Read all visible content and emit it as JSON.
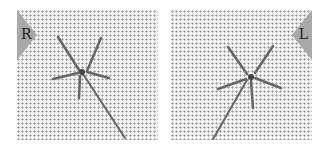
{
  "panels": [
    {
      "id": "right-hand",
      "label": "R",
      "flag_color": "#a8a8a8"
    },
    {
      "id": "left-hand",
      "label": "L",
      "flag_color": "#a8a8a8"
    }
  ],
  "colors": {
    "fabric": "#f4f4f4",
    "fabric_holes": "#9a9a9a",
    "thread": "#666666",
    "background": "#ffffff"
  }
}
